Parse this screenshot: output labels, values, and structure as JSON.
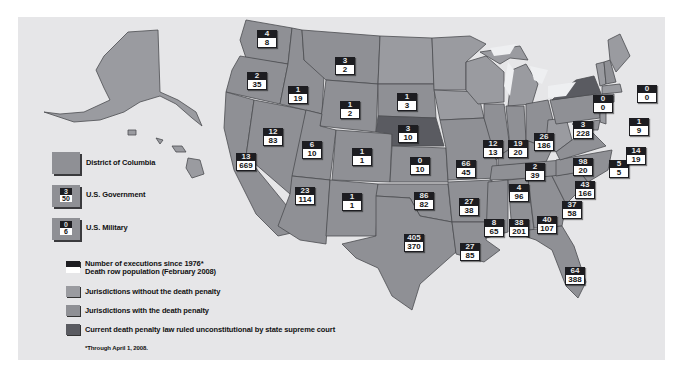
{
  "colors": {
    "background": "#e6e6e8",
    "with_death_penalty": "#8f9095",
    "without_death_penalty": "#9a9ba0",
    "unconstitutional": "#5a5b61",
    "executions_box": "#1d1d21",
    "death_row_box": "#ffffff"
  },
  "legend": {
    "dc": {
      "label": "District of Columbia"
    },
    "us_government": {
      "label": "U.S. Government",
      "executions": "3",
      "death_row": "50"
    },
    "us_military": {
      "label": "U.S. Military",
      "executions": "0",
      "death_row": "6"
    },
    "executions_label": "Number of executions since 1976*",
    "death_row_label": "Death row population (February 2008)",
    "without_label": "Jurisdictions without the death penalty",
    "with_label": "Jurisdictions with the death penalty",
    "unconstitutional_label": "Current death penalty law ruled unconstitutional by state supreme court",
    "footnote": "*Through April 1, 2008."
  },
  "states": [
    {
      "name": "Washington",
      "executions": "4",
      "death_row": "8"
    },
    {
      "name": "Oregon",
      "executions": "2",
      "death_row": "35"
    },
    {
      "name": "Idaho",
      "executions": "1",
      "death_row": "19"
    },
    {
      "name": "Montana",
      "executions": "3",
      "death_row": "2"
    },
    {
      "name": "Wyoming",
      "executions": "1",
      "death_row": "2"
    },
    {
      "name": "South Dakota",
      "executions": "1",
      "death_row": "3"
    },
    {
      "name": "Nebraska",
      "executions": "3",
      "death_row": "10"
    },
    {
      "name": "Nevada",
      "executions": "12",
      "death_row": "83"
    },
    {
      "name": "Utah",
      "executions": "6",
      "death_row": "10"
    },
    {
      "name": "California",
      "executions": "13",
      "death_row": "669"
    },
    {
      "name": "Colorado",
      "executions": "1",
      "death_row": "1"
    },
    {
      "name": "Kansas",
      "executions": "0",
      "death_row": "10"
    },
    {
      "name": "Arizona",
      "executions": "23",
      "death_row": "114"
    },
    {
      "name": "New Mexico",
      "executions": "1",
      "death_row": "1"
    },
    {
      "name": "Oklahoma",
      "executions": "86",
      "death_row": "82"
    },
    {
      "name": "Texas",
      "executions": "405",
      "death_row": "370"
    },
    {
      "name": "Missouri",
      "executions": "66",
      "death_row": "45"
    },
    {
      "name": "Arkansas",
      "executions": "27",
      "death_row": "38"
    },
    {
      "name": "Louisiana",
      "executions": "27",
      "death_row": "85"
    },
    {
      "name": "Illinois",
      "executions": "12",
      "death_row": "13"
    },
    {
      "name": "Indiana",
      "executions": "19",
      "death_row": "20"
    },
    {
      "name": "Ohio",
      "executions": "26",
      "death_row": "186"
    },
    {
      "name": "Kentucky",
      "executions": "2",
      "death_row": "39"
    },
    {
      "name": "Tennessee",
      "executions": "4",
      "death_row": "96"
    },
    {
      "name": "Mississippi",
      "executions": "8",
      "death_row": "65"
    },
    {
      "name": "Alabama",
      "executions": "38",
      "death_row": "201"
    },
    {
      "name": "Georgia",
      "executions": "40",
      "death_row": "107"
    },
    {
      "name": "Florida",
      "executions": "64",
      "death_row": "388"
    },
    {
      "name": "South Carolina",
      "executions": "37",
      "death_row": "58"
    },
    {
      "name": "North Carolina",
      "executions": "43",
      "death_row": "166"
    },
    {
      "name": "Virginia",
      "executions": "98",
      "death_row": "20"
    },
    {
      "name": "Pennsylvania",
      "executions": "3",
      "death_row": "228"
    },
    {
      "name": "New York",
      "executions": "0",
      "death_row": "0"
    },
    {
      "name": "New Hampshire",
      "executions": "0",
      "death_row": "0"
    },
    {
      "name": "Connecticut",
      "executions": "1",
      "death_row": "9"
    },
    {
      "name": "Maryland",
      "executions": "5",
      "death_row": "5"
    },
    {
      "name": "Delaware",
      "executions": "14",
      "death_row": "19"
    }
  ]
}
